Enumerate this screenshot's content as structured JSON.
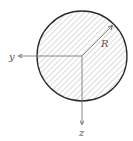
{
  "diagram": {
    "labels": {
      "y_axis": "y",
      "z_axis": "z",
      "radius": "R"
    },
    "colors": {
      "outline": "#2a2a2a",
      "hatch": "#b5b5b5",
      "axis": "#6a6a6a"
    }
  }
}
